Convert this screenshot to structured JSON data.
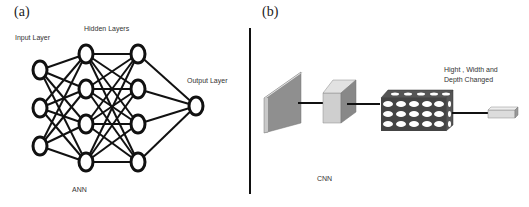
{
  "panels": {
    "a": {
      "label": "(a)",
      "title": "ANN",
      "layers": {
        "input": "Input Layer",
        "hidden": "Hidden Layers",
        "output": "Output Layer"
      },
      "nodes": {
        "input": 3,
        "hidden1": 4,
        "hidden2": 4,
        "output": 1
      }
    },
    "b": {
      "label": "(b)",
      "title": "CNN",
      "annotation_line1": "Hight , Width and",
      "annotation_line2": "Depth Changed"
    }
  }
}
